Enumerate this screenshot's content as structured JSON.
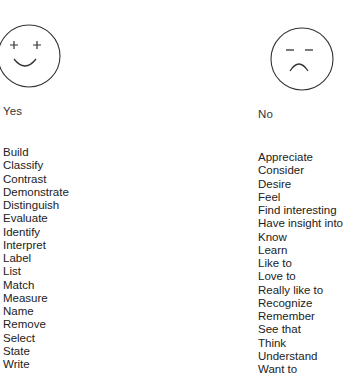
{
  "columns": {
    "yes": {
      "face_icon": "happy-face-icon",
      "heading": "Yes",
      "items": [
        "Build",
        "Classify",
        "Contrast",
        "Demonstrate",
        "Distinguish",
        "Evaluate",
        "Identify",
        "Interpret",
        "Label",
        "List",
        "Match",
        "Measure",
        "Name",
        "Remove",
        "Select",
        "State",
        "Write"
      ]
    },
    "no": {
      "face_icon": "sad-face-icon",
      "heading": "No",
      "items": [
        "Appreciate",
        "Consider",
        "Desire",
        "Feel",
        "Find interesting",
        "Have insight into",
        "Know",
        "Learn",
        "Like to",
        "Love to",
        "Really like to",
        "Recognize",
        "Remember",
        "See that",
        "Think",
        "Understand",
        "Want to"
      ]
    }
  },
  "colors": {
    "ink": "#222222",
    "background": "#ffffff"
  }
}
